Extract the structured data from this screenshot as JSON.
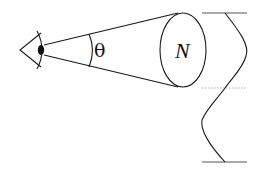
{
  "diagram": {
    "labels": {
      "angle": "θ",
      "count": "N"
    },
    "elements": {
      "observer": "eye-icon",
      "cone": "viewing-cone",
      "cross_section": "ellipse",
      "wave": "sine-wave",
      "midline": "dotted-line",
      "boundaries": [
        "top-bar",
        "bottom-bar"
      ]
    },
    "colors": {
      "line": "#1a1a1a",
      "midline": "#999999",
      "background": "#ffffff"
    }
  }
}
